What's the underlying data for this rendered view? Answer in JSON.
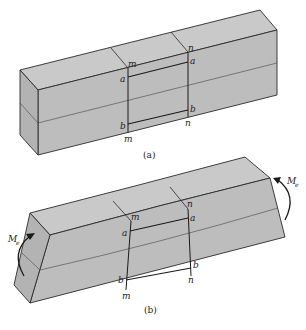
{
  "figure": {
    "colors": {
      "face_top": "#c9c9c9",
      "face_front": "#bdbdbd",
      "face_end": "#b3b3b3",
      "edge": "#2a2a2a",
      "background": "#ffffff"
    },
    "panel_a": {
      "caption": "(a)",
      "labels": {
        "m_top": "m",
        "n_top": "n",
        "a_left": "a",
        "a_right": "a",
        "b_left": "b",
        "b_right": "b",
        "m_bottom": "m",
        "n_bottom": "n"
      }
    },
    "panel_b": {
      "caption": "(b)",
      "labels": {
        "m_top": "m",
        "n_top": "n",
        "a_left": "a",
        "a_right": "a",
        "b_left": "b",
        "b_right": "b",
        "m_bottom": "m",
        "n_bottom": "n"
      },
      "moment_left": {
        "symbol": "M",
        "subscript": "e"
      },
      "moment_right": {
        "symbol": "M",
        "subscript": "e"
      }
    }
  }
}
